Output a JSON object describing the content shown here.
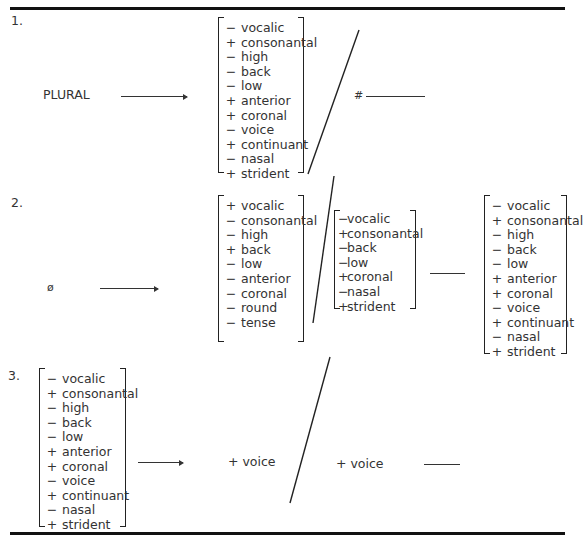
{
  "rules": [
    {
      "index": "1.",
      "input": "PLURAL",
      "boundary": "#"
    },
    {
      "index": "2.",
      "input": "ø"
    },
    {
      "index": "3.",
      "output_feature": "+ voice",
      "context_feature": "+ voice"
    }
  ],
  "matrices": {
    "r1_output": [
      {
        "sign": "−",
        "feature": "vocalic"
      },
      {
        "sign": "+",
        "feature": "consonantal"
      },
      {
        "sign": "−",
        "feature": "high"
      },
      {
        "sign": "−",
        "feature": "back"
      },
      {
        "sign": "−",
        "feature": "low"
      },
      {
        "sign": "+",
        "feature": "anterior"
      },
      {
        "sign": "+",
        "feature": "coronal"
      },
      {
        "sign": "−",
        "feature": "voice"
      },
      {
        "sign": "+",
        "feature": "continuant"
      },
      {
        "sign": "−",
        "feature": "nasal"
      },
      {
        "sign": "+",
        "feature": "strident"
      }
    ],
    "r2_output": [
      {
        "sign": "+",
        "feature": "vocalic"
      },
      {
        "sign": "−",
        "feature": "consonantal"
      },
      {
        "sign": "−",
        "feature": "high"
      },
      {
        "sign": "+",
        "feature": "back"
      },
      {
        "sign": "−",
        "feature": "low"
      },
      {
        "sign": "−",
        "feature": "anterior"
      },
      {
        "sign": "−",
        "feature": "coronal"
      },
      {
        "sign": "−",
        "feature": "round"
      },
      {
        "sign": "−",
        "feature": "tense"
      }
    ],
    "r2_left_context": [
      {
        "sign": "−",
        "feature": "vocalic"
      },
      {
        "sign": "+",
        "feature": "consonantal"
      },
      {
        "sign": "−",
        "feature": "back"
      },
      {
        "sign": "−",
        "feature": "low"
      },
      {
        "sign": "+",
        "feature": "coronal"
      },
      {
        "sign": "−",
        "feature": "nasal"
      },
      {
        "sign": "+",
        "feature": "strident"
      }
    ],
    "r2_right_context": [
      {
        "sign": "−",
        "feature": "vocalic"
      },
      {
        "sign": "+",
        "feature": "consonantal"
      },
      {
        "sign": "−",
        "feature": "high"
      },
      {
        "sign": "−",
        "feature": "back"
      },
      {
        "sign": "−",
        "feature": "low"
      },
      {
        "sign": "+",
        "feature": "anterior"
      },
      {
        "sign": "+",
        "feature": "coronal"
      },
      {
        "sign": "−",
        "feature": "voice"
      },
      {
        "sign": "+",
        "feature": "continuant"
      },
      {
        "sign": "−",
        "feature": "nasal"
      },
      {
        "sign": "+",
        "feature": "strident"
      }
    ],
    "r3_input": [
      {
        "sign": "−",
        "feature": "vocalic"
      },
      {
        "sign": "+",
        "feature": "consonantal"
      },
      {
        "sign": "−",
        "feature": "high"
      },
      {
        "sign": "−",
        "feature": "back"
      },
      {
        "sign": "−",
        "feature": "low"
      },
      {
        "sign": "+",
        "feature": "anterior"
      },
      {
        "sign": "+",
        "feature": "coronal"
      },
      {
        "sign": "−",
        "feature": "voice"
      },
      {
        "sign": "+",
        "feature": "continuant"
      },
      {
        "sign": "−",
        "feature": "nasal"
      },
      {
        "sign": "+",
        "feature": "strident"
      }
    ]
  }
}
